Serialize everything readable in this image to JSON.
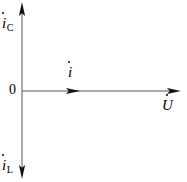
{
  "figure": {
    "background_color": "#ffffff",
    "line_color": "#4a4a4a",
    "arrow_color": "#000000",
    "text_color": "#000000"
  },
  "axes": {
    "origin": {
      "x": 22,
      "y": 91
    },
    "vertical": {
      "name": "current-axis",
      "top_y": 3,
      "bottom_y": 178,
      "arrow_up": true,
      "arrow_down": true
    },
    "horizontal": {
      "name": "voltage-axis",
      "start_x": 22,
      "end_x": 180,
      "arrow_right": true
    }
  },
  "labels": {
    "origin": "0",
    "capacitive_current": {
      "base": "i",
      "subscript": "C",
      "overdot": true
    },
    "inductive_current": {
      "base": "i",
      "subscript": "L",
      "overdot": true
    },
    "total_current": {
      "base": "i",
      "subscript": "",
      "overdot": true
    },
    "voltage": {
      "base": "U",
      "subscript": "",
      "overdot": true
    }
  },
  "phasors": [
    {
      "name": "capacitive-current-phasor",
      "label": "iC",
      "direction": "up",
      "from": {
        "x": 22,
        "y": 91
      },
      "to": {
        "x": 22,
        "y": 3
      }
    },
    {
      "name": "inductive-current-phasor",
      "label": "iL",
      "direction": "down",
      "from": {
        "x": 22,
        "y": 91
      },
      "to": {
        "x": 22,
        "y": 178
      }
    },
    {
      "name": "total-current-phasor",
      "label": "i",
      "direction": "right",
      "from": {
        "x": 22,
        "y": 91
      },
      "to": {
        "x": 80,
        "y": 91
      }
    },
    {
      "name": "voltage-phasor",
      "label": "U",
      "direction": "right",
      "from": {
        "x": 22,
        "y": 91
      },
      "to": {
        "x": 180,
        "y": 91
      }
    }
  ]
}
